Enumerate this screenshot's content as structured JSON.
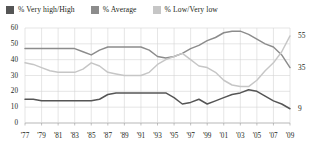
{
  "legend": {
    "items": [
      {
        "label": "% Very high/High",
        "color": "#555555",
        "icon": "legend-swatch-icon"
      },
      {
        "label": "% Average",
        "color": "#8c8c8c",
        "icon": "legend-swatch-icon"
      },
      {
        "label": "% Low/Very low",
        "color": "#c6c6c6",
        "icon": "legend-swatch-icon"
      }
    ]
  },
  "axis": {
    "y_ticks": [
      "0",
      "10",
      "20",
      "30",
      "40",
      "50",
      "60"
    ],
    "x_ticks": [
      "'77",
      "'79",
      "'81",
      "'83",
      "'85",
      "'87",
      "'89",
      "'91",
      "'93",
      "'95",
      "'97",
      "'99",
      "'01",
      "'03",
      "'05",
      "'07",
      "'09"
    ]
  },
  "end_labels": [
    {
      "name": "end-label-low-very-low",
      "value": "55"
    },
    {
      "name": "end-label-average",
      "value": "35"
    },
    {
      "name": "end-label-very-high",
      "value": "9"
    }
  ],
  "chart_data": {
    "type": "line",
    "title": "",
    "xlabel": "",
    "ylabel": "",
    "ylim": [
      0,
      60
    ],
    "xlim": [
      1977,
      2009
    ],
    "grid": true,
    "legend_position": "top-left",
    "x": [
      1977,
      1978,
      1979,
      1980,
      1981,
      1982,
      1983,
      1984,
      1985,
      1986,
      1987,
      1988,
      1989,
      1990,
      1991,
      1992,
      1993,
      1994,
      1995,
      1996,
      1997,
      1998,
      1999,
      2000,
      2001,
      2002,
      2003,
      2004,
      2005,
      2006,
      2007,
      2008,
      2009
    ],
    "series": [
      {
        "name": "% Very high/High",
        "color": "#555555",
        "end_value": 9,
        "values": [
          15,
          15,
          14,
          14,
          14,
          14,
          14,
          14,
          14,
          15,
          18,
          19,
          19,
          19,
          19,
          19,
          19,
          19,
          16,
          12,
          13,
          15,
          12,
          14,
          16,
          18,
          19,
          21,
          20,
          17,
          14,
          12,
          9
        ]
      },
      {
        "name": "% Average",
        "color": "#8c8c8c",
        "end_value": 35,
        "values": [
          47,
          47,
          47,
          47,
          47,
          47,
          47,
          45,
          43,
          46,
          48,
          48,
          48,
          48,
          48,
          46,
          42,
          41,
          42,
          44,
          47,
          49,
          52,
          54,
          57,
          58,
          58,
          56,
          53,
          50,
          48,
          43,
          35
        ]
      },
      {
        "name": "% Low/Very low",
        "color": "#c6c6c6",
        "end_value": 55,
        "values": [
          38,
          37,
          35,
          33,
          32,
          32,
          32,
          34,
          38,
          36,
          32,
          31,
          30,
          30,
          30,
          32,
          37,
          40,
          42,
          44,
          40,
          36,
          35,
          32,
          27,
          24,
          23,
          23,
          27,
          33,
          38,
          45,
          55
        ]
      }
    ]
  }
}
